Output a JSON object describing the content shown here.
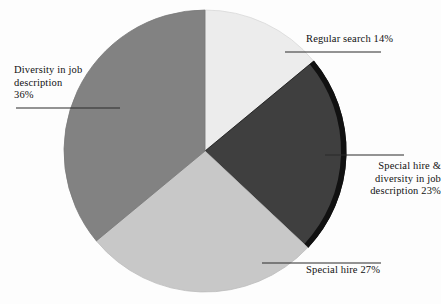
{
  "chart_data": {
    "type": "pie",
    "title": "",
    "subtitle": "",
    "xlabel": "",
    "ylabel": "",
    "legend_position": "none",
    "grid": false,
    "start_angle_deg": 0,
    "direction": "clockwise",
    "categories": [
      "Regular search",
      "Special hire & diversity in job description",
      "Special hire",
      "Diversity in job description"
    ],
    "values": [
      14,
      23,
      27,
      36
    ],
    "value_unit": "%",
    "total": 100,
    "slices": [
      {
        "name": "Regular search",
        "value": 14,
        "color": "#ececec",
        "outline_color": "#d8d8d8",
        "label_text": "Regular search 14%",
        "label_lines": "Regular search 14%"
      },
      {
        "name": "Special hire & diversity in job description",
        "value": 23,
        "color": "#3f3f3f",
        "outline_color": "#111111",
        "label_text": "Special hire & diversity in job description 23%",
        "label_lines": "Special hire &\ndiversity in job\ndescription 23%"
      },
      {
        "name": "Special hire",
        "value": 27,
        "color": "#c8c8c8",
        "outline_color": "#bdbdbd",
        "label_text": "Special hire 27%",
        "label_lines": "Special hire 27%"
      },
      {
        "name": "Diversity in job description",
        "value": 36,
        "color": "#828282",
        "outline_color": "#7a7a7a",
        "label_text": "Diversity in job description 36%",
        "label_lines": "Diversity in job\ndescription\n36%"
      }
    ]
  },
  "labels": {
    "regular_search": "Regular search 14%",
    "special_hire_and_diversity": "Special hire &\ndiversity in job\ndescription 23%",
    "diversity_in_job_description": "Diversity in job\ndescription\n36%",
    "special_hire": "Special hire 27%"
  },
  "colors": {
    "background": "#fdfdfd",
    "text": "#111111",
    "leader_line": "#2a2a2a",
    "slice_light": "#ececec",
    "slice_dark": "#3f3f3f",
    "slice_midlight": "#c8c8c8",
    "slice_mid": "#828282",
    "rim_dark": "#111111"
  },
  "geometry": {
    "center_x": 205,
    "center_y": 151,
    "radius": 141
  }
}
